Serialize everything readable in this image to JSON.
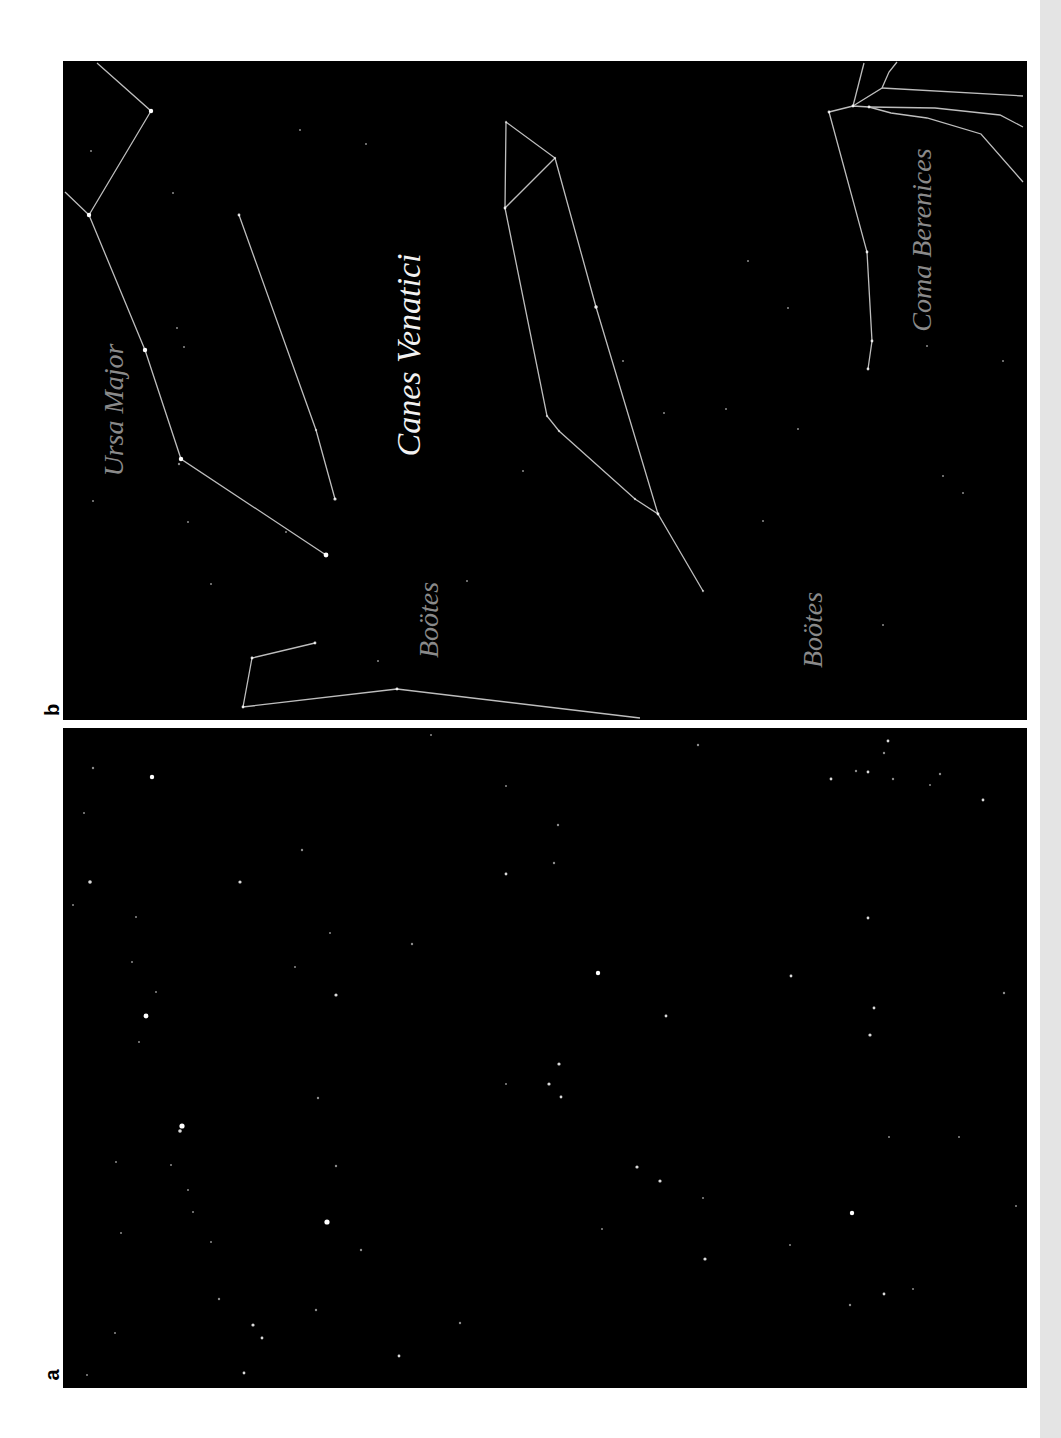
{
  "figure": {
    "panels": [
      {
        "id": "b",
        "label": "b",
        "description": "Star field with constellation lines and names",
        "labels": [
          {
            "text": "Ursa Major",
            "x": 54,
            "y": 349,
            "size": 28,
            "color": "#8a8a8a"
          },
          {
            "text": "Canes Venatici",
            "x": 349,
            "y": 294,
            "size": 34,
            "color": "#f2f2f2"
          },
          {
            "text": "Boötes",
            "x": 369,
            "y": 559,
            "size": 28,
            "color": "#8a8a8a"
          },
          {
            "text": "Boötes",
            "x": 753,
            "y": 569,
            "size": 28,
            "color": "#8a8a8a"
          },
          {
            "text": "Coma Berenices",
            "x": 862,
            "y": 179,
            "size": 28,
            "color": "#8a8a8a"
          }
        ],
        "lines": [
          {
            "name": "ursa-major",
            "points": [
              [
                34,
                2
              ],
              [
                88,
                50
              ],
              [
                26,
                154
              ],
              [
                2,
                131
              ]
            ]
          },
          {
            "name": "ursa-major",
            "points": [
              [
                26,
                154
              ],
              [
                82,
                289
              ],
              [
                118,
                398
              ],
              [
                263,
                494
              ]
            ]
          },
          {
            "name": "ursa-major-bear",
            "points": [
              [
                176,
                154
              ],
              [
                253,
                369
              ],
              [
                272,
                438
              ]
            ]
          },
          {
            "name": "canes-venatici",
            "points": [
              [
                443,
                61
              ],
              [
                492,
                97
              ],
              [
                442,
                147
              ],
              [
                443,
                61
              ]
            ]
          },
          {
            "name": "canes-venatici",
            "points": [
              [
                492,
                97
              ],
              [
                533,
                246
              ],
              [
                595,
                453
              ]
            ]
          },
          {
            "name": "canes-venatici",
            "points": [
              [
                442,
                147
              ],
              [
                484,
                355
              ],
              [
                496,
                370
              ],
              [
                572,
                438
              ],
              [
                595,
                453
              ],
              [
                640,
                530
              ]
            ]
          },
          {
            "name": "bootes",
            "points": [
              [
                252,
                582
              ],
              [
                189,
                597
              ],
              [
                180,
                646
              ],
              [
                334,
                628
              ],
              [
                577,
                657
              ]
            ]
          },
          {
            "name": "coma-berenices",
            "points": [
              [
                801,
                2
              ],
              [
                790,
                45
              ]
            ]
          },
          {
            "name": "coma-berenices",
            "points": [
              [
                834,
                1
              ],
              [
                826,
                11
              ],
              [
                819,
                27
              ],
              [
                790,
                45
              ]
            ]
          },
          {
            "name": "coma-berenices",
            "points": [
              [
                766,
                51
              ],
              [
                790,
                45
              ],
              [
                806,
                46
              ]
            ]
          },
          {
            "name": "coma-berenices",
            "points": [
              [
                819,
                27
              ],
              [
                960,
                35
              ]
            ]
          },
          {
            "name": "coma-berenices",
            "points": [
              [
                806,
                46
              ],
              [
                872,
                47
              ],
              [
                937,
                54
              ],
              [
                960,
                66
              ]
            ]
          },
          {
            "name": "coma-berenices",
            "points": [
              [
                806,
                46
              ],
              [
                828,
                52
              ],
              [
                864,
                57
              ],
              [
                918,
                73
              ],
              [
                960,
                121
              ]
            ]
          },
          {
            "name": "coma-berenices",
            "points": [
              [
                766,
                51
              ],
              [
                804,
                191
              ],
              [
                809,
                280
              ],
              [
                805,
                308
              ]
            ]
          }
        ],
        "stars": [
          [
            88,
            50,
            2.2
          ],
          [
            26,
            154,
            2.2
          ],
          [
            82,
            289,
            2.2
          ],
          [
            118,
            398,
            2.2
          ],
          [
            116,
            403,
            1.2
          ],
          [
            263,
            494,
            2.4
          ],
          [
            176,
            154,
            1.4
          ],
          [
            253,
            369,
            1.2
          ],
          [
            272,
            438,
            1.6
          ],
          [
            443,
            61,
            1.2
          ],
          [
            492,
            97,
            1.2
          ],
          [
            442,
            147,
            1.4
          ],
          [
            533,
            246,
            1.8
          ],
          [
            484,
            355,
            1.2
          ],
          [
            496,
            370,
            1.2
          ],
          [
            572,
            438,
            1.2
          ],
          [
            595,
            453,
            1.4
          ],
          [
            640,
            530,
            1.2
          ],
          [
            252,
            582,
            1.4
          ],
          [
            189,
            597,
            1.4
          ],
          [
            180,
            646,
            1.4
          ],
          [
            334,
            628,
            1.4
          ],
          [
            315,
            600,
            1.0
          ],
          [
            804,
            191,
            1.4
          ],
          [
            809,
            280,
            1.4
          ],
          [
            805,
            308,
            1.4
          ],
          [
            766,
            51,
            1.4
          ],
          [
            790,
            45,
            1.4
          ],
          [
            806,
            46,
            1.4
          ],
          [
            28,
            90,
            1.0
          ],
          [
            110,
            132,
            1.0
          ],
          [
            237,
            69,
            1.0
          ],
          [
            303,
            83,
            1.0
          ],
          [
            114,
            267,
            1.0
          ],
          [
            121,
            286,
            1.0
          ],
          [
            125,
            461,
            1.0
          ],
          [
            148,
            523,
            1.0
          ],
          [
            223,
            471,
            1.0
          ],
          [
            560,
            300,
            1.0
          ],
          [
            601,
            352,
            1.0
          ],
          [
            663,
            348,
            1.0
          ],
          [
            725,
            247,
            1.0
          ],
          [
            735,
            368,
            1.0
          ],
          [
            864,
            285,
            1.0
          ],
          [
            880,
            415,
            1.0
          ],
          [
            820,
            564,
            1.0
          ],
          [
            900,
            432,
            1.0
          ],
          [
            404,
            520,
            1.0
          ],
          [
            460,
            410,
            1.0
          ],
          [
            685,
            200,
            1.0
          ],
          [
            940,
            300,
            1.0
          ],
          [
            30,
            440,
            1.0
          ],
          [
            700,
            460,
            1.0
          ]
        ]
      },
      {
        "id": "a",
        "label": "a",
        "description": "Unlabeled star field photograph",
        "stars": [
          [
            30,
            40,
            1.2
          ],
          [
            89,
            49,
            2.2
          ],
          [
            27,
            154,
            1.8
          ],
          [
            177,
            154,
            1.6
          ],
          [
            239,
            122,
            1.2
          ],
          [
            443,
            146,
            1.4
          ],
          [
            349,
            216,
            1.2
          ],
          [
            273,
            267,
            1.6
          ],
          [
            83,
            288,
            2.4
          ],
          [
            76,
            314,
            1.0
          ],
          [
            368,
            7,
            1.0
          ],
          [
            443,
            58,
            1.0
          ],
          [
            267,
            205,
            1.0
          ],
          [
            232,
            239,
            1.0
          ],
          [
            93,
            264,
            1.0
          ],
          [
            69,
            234,
            1.0
          ],
          [
            10,
            177,
            1.0
          ],
          [
            73,
            189,
            1.0
          ],
          [
            21,
            85,
            1.0
          ],
          [
            635,
            17,
            1.2
          ],
          [
            825,
            13,
            1.4
          ],
          [
            821,
            25,
            1.2
          ],
          [
            793,
            43,
            1.2
          ],
          [
            805,
            44,
            1.4
          ],
          [
            768,
            51,
            1.4
          ],
          [
            830,
            51,
            1.2
          ],
          [
            877,
            46,
            1.2
          ],
          [
            867,
            57,
            1.0
          ],
          [
            920,
            72,
            1.4
          ],
          [
            495,
            97,
            1.2
          ],
          [
            491,
            135,
            1.2
          ],
          [
            805,
            190,
            1.4
          ],
          [
            535,
            245,
            2.2
          ],
          [
            728,
            248,
            1.4
          ],
          [
            603,
            288,
            1.4
          ],
          [
            811,
            280,
            1.4
          ],
          [
            807,
            307,
            1.6
          ],
          [
            941,
            265,
            1.2
          ],
          [
            119,
            398,
            2.6
          ],
          [
            117,
            403,
            1.8
          ],
          [
            255,
            370,
            1.2
          ],
          [
            53,
            434,
            1.0
          ],
          [
            108,
            437,
            1.0
          ],
          [
            125,
            462,
            1.0
          ],
          [
            130,
            484,
            1.0
          ],
          [
            273,
            438,
            1.2
          ],
          [
            264,
            494,
            2.6
          ],
          [
            298,
            522,
            1.2
          ],
          [
            58,
            505,
            1.0
          ],
          [
            148,
            514,
            1.0
          ],
          [
            156,
            571,
            1.2
          ],
          [
            190,
            597,
            1.6
          ],
          [
            199,
            610,
            1.4
          ],
          [
            253,
            582,
            1.2
          ],
          [
            336,
            628,
            1.4
          ],
          [
            397,
            595,
            1.2
          ],
          [
            181,
            645,
            1.4
          ],
          [
            52,
            605,
            1.0
          ],
          [
            24,
            647,
            1.0
          ],
          [
            443,
            356,
            1.0
          ],
          [
            496,
            336,
            1.6
          ],
          [
            486,
            356,
            1.6
          ],
          [
            498,
            369,
            1.4
          ],
          [
            574,
            439,
            1.6
          ],
          [
            597,
            453,
            1.6
          ],
          [
            789,
            485,
            2.2
          ],
          [
            642,
            531,
            1.6
          ],
          [
            727,
            517,
            1.0
          ],
          [
            821,
            566,
            1.4
          ],
          [
            787,
            577,
            1.2
          ],
          [
            896,
            409,
            1.0
          ],
          [
            953,
            478,
            1.0
          ],
          [
            539,
            501,
            1.0
          ],
          [
            850,
            561,
            1.0
          ],
          [
            826,
            409,
            1.0
          ],
          [
            640,
            470,
            1.0
          ]
        ]
      }
    ]
  },
  "chrome": {
    "page_strip_color": "#e4e4e4",
    "panel_background": "#000000",
    "line_color": "#bdbdbd",
    "star_color": "#ffffff"
  }
}
